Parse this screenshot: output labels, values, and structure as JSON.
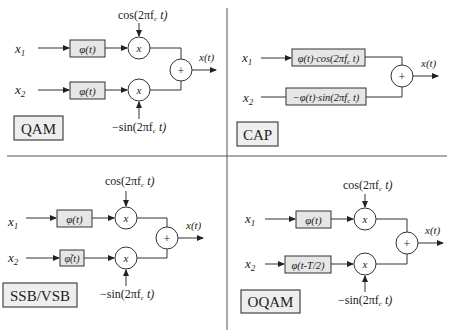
{
  "figure": {
    "panels": [
      {
        "id": "qam",
        "title": "QAM",
        "inputs": [
          "x1",
          "x2"
        ],
        "input_labels": {
          "x1_base": "x",
          "x1_sub": "1",
          "x2_base": "x",
          "x2_sub": "2"
        },
        "filters": [
          "φ(t)",
          "φ(t)"
        ],
        "carrier_top": "cos(2πf",
        "carrier_top_sub": "c",
        "carrier_top_tail": " t)",
        "carrier_bottom": "−sin(2πf",
        "carrier_bottom_sub": "c",
        "carrier_bottom_tail": " t)",
        "multiplier_symbol": "x",
        "sum_symbol": "+",
        "output": "x(t)"
      },
      {
        "id": "cap",
        "title": "CAP",
        "input_labels": {
          "x1_base": "x",
          "x1_sub": "1",
          "x2_base": "x",
          "x2_sub": "2"
        },
        "filter_top_a": "φ(t)·cos(2πf",
        "filter_top_sub": "c",
        "filter_top_tail": " t)",
        "filter_bottom_a": "−φ(t)·sin(2πf",
        "filter_bottom_sub": "c",
        "filter_bottom_tail": " t)",
        "sum_symbol": "+",
        "output": "x(t)"
      },
      {
        "id": "ssb-vsb",
        "title": "SSB/VSB",
        "input_labels": {
          "x1_base": "x",
          "x1_sub": "1",
          "x2_base": "x",
          "x2_sub": "2"
        },
        "filters": [
          "φ(t)",
          "φ̃(t)"
        ],
        "carrier_top": "cos(2πf",
        "carrier_top_sub": "c",
        "carrier_top_tail": " t)",
        "carrier_bottom": "−sin(2πf",
        "carrier_bottom_sub": "c",
        "carrier_bottom_tail": " t)",
        "multiplier_symbol": "x",
        "sum_symbol": "+",
        "output": "x(t)"
      },
      {
        "id": "oqam",
        "title": "OQAM",
        "input_labels": {
          "x1_base": "x",
          "x1_sub": "1",
          "x2_base": "x",
          "x2_sub": "2"
        },
        "filters": [
          "φ(t)",
          "φ(t-T/2)"
        ],
        "carrier_top": "cos(2πf",
        "carrier_top_sub": "c",
        "carrier_top_tail": " t)",
        "carrier_bottom": "−sin(2πf",
        "carrier_bottom_sub": "c",
        "carrier_bottom_tail": " t)",
        "multiplier_symbol": "x",
        "sum_symbol": "+",
        "output": "x(t)"
      }
    ]
  }
}
